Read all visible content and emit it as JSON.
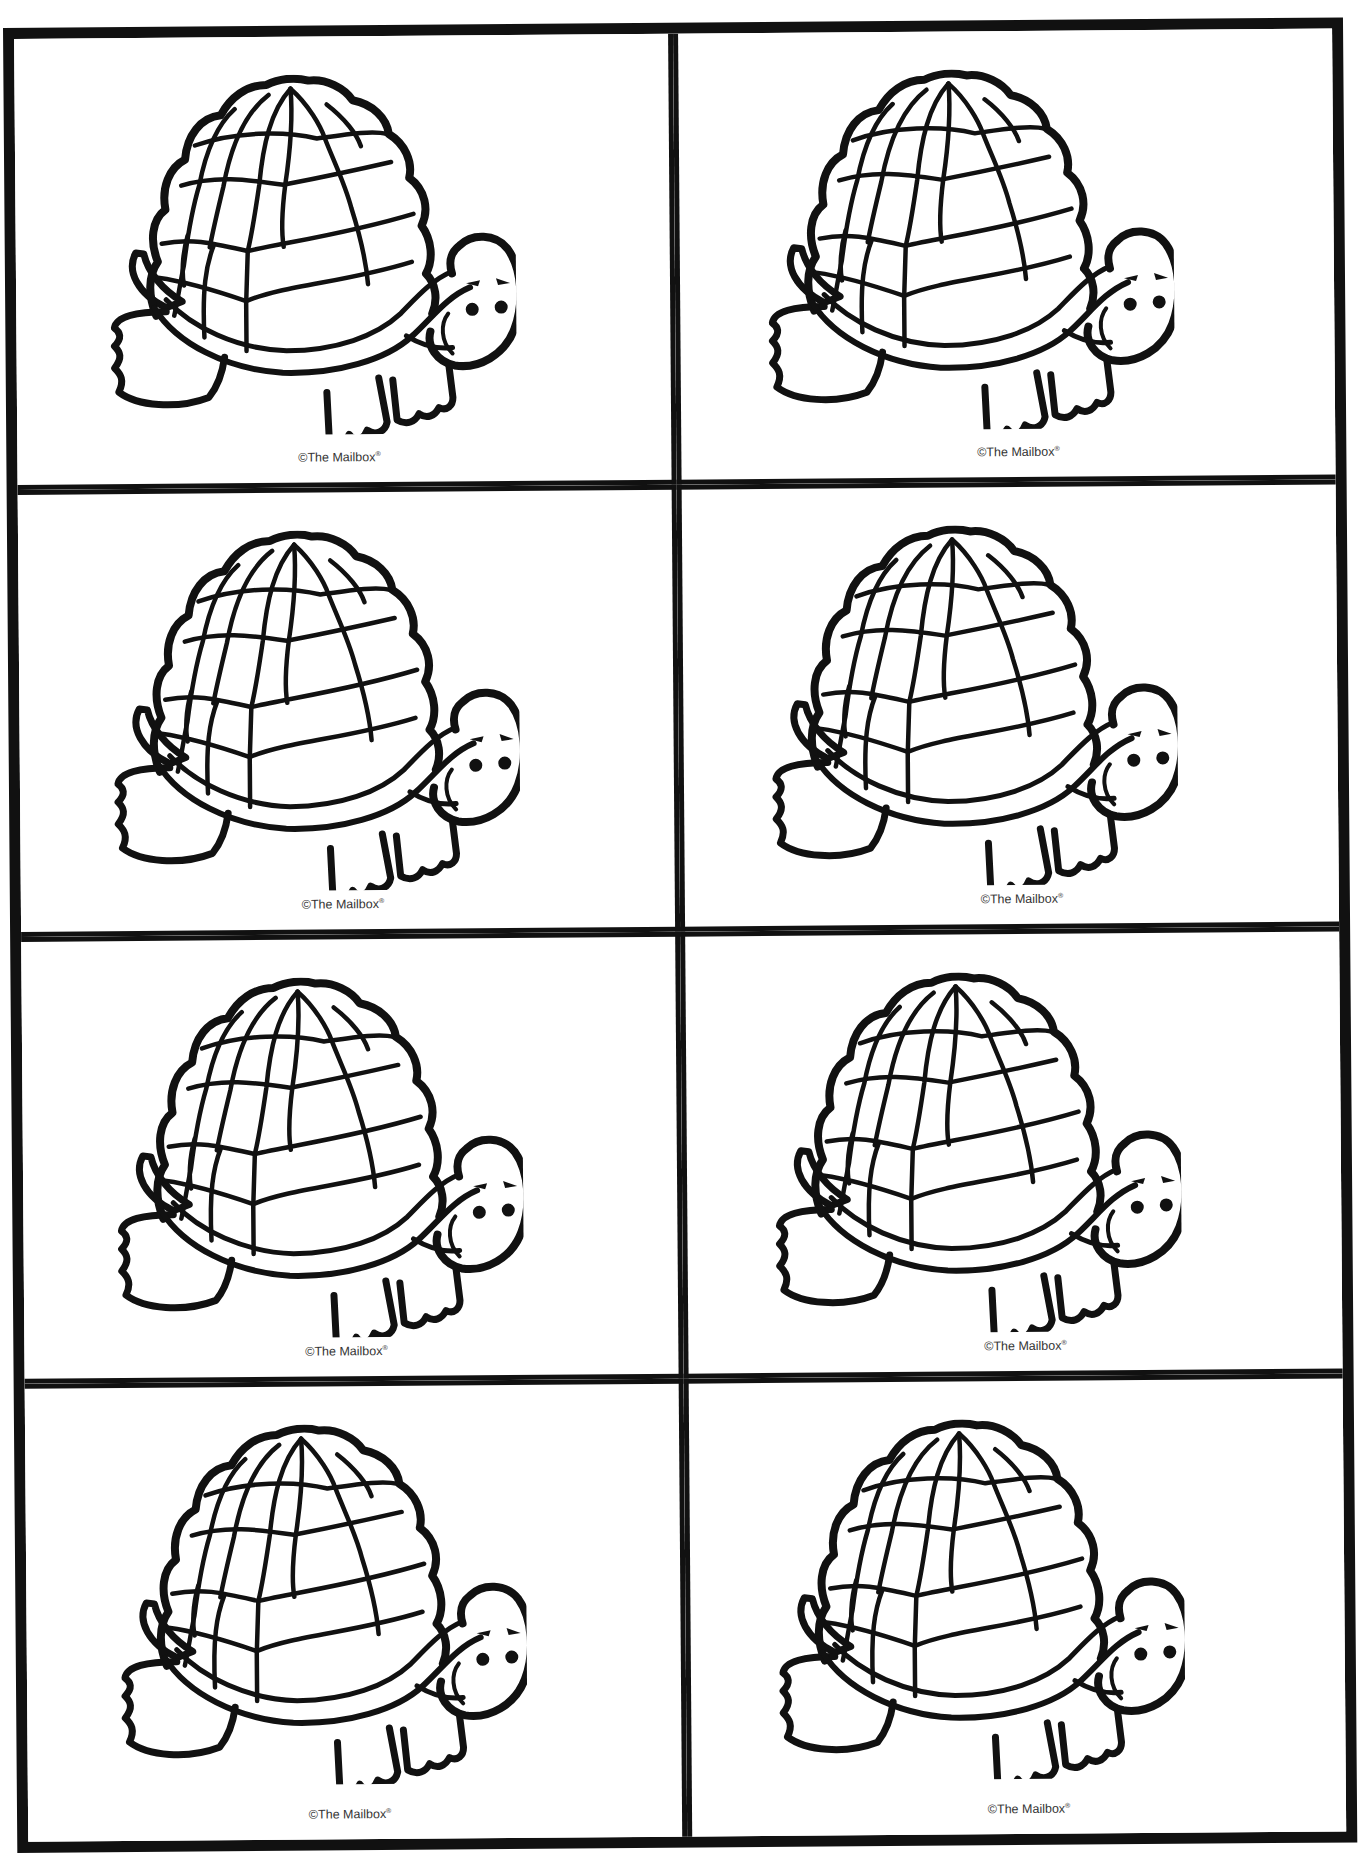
{
  "sheet": {
    "layout": {
      "columns": 2,
      "rows": 4
    },
    "border_color": "#111111",
    "background": "#ffffff"
  },
  "cards": [
    {
      "illustration": "turtle-icon",
      "caption": "©The Mailbox",
      "caption_mark": "®"
    },
    {
      "illustration": "turtle-icon",
      "caption": "©The Mailbox",
      "caption_mark": "®"
    },
    {
      "illustration": "turtle-icon",
      "caption": "©The Mailbox",
      "caption_mark": "®"
    },
    {
      "illustration": "turtle-icon",
      "caption": "©The Mailbox",
      "caption_mark": "®"
    },
    {
      "illustration": "turtle-icon",
      "caption": "©The Mailbox",
      "caption_mark": "®"
    },
    {
      "illustration": "turtle-icon",
      "caption": "©The Mailbox",
      "caption_mark": "®"
    },
    {
      "illustration": "turtle-icon",
      "caption": "©The Mailbox",
      "caption_mark": "®"
    },
    {
      "illustration": "turtle-icon",
      "caption": "©The Mailbox",
      "caption_mark": "®"
    }
  ]
}
